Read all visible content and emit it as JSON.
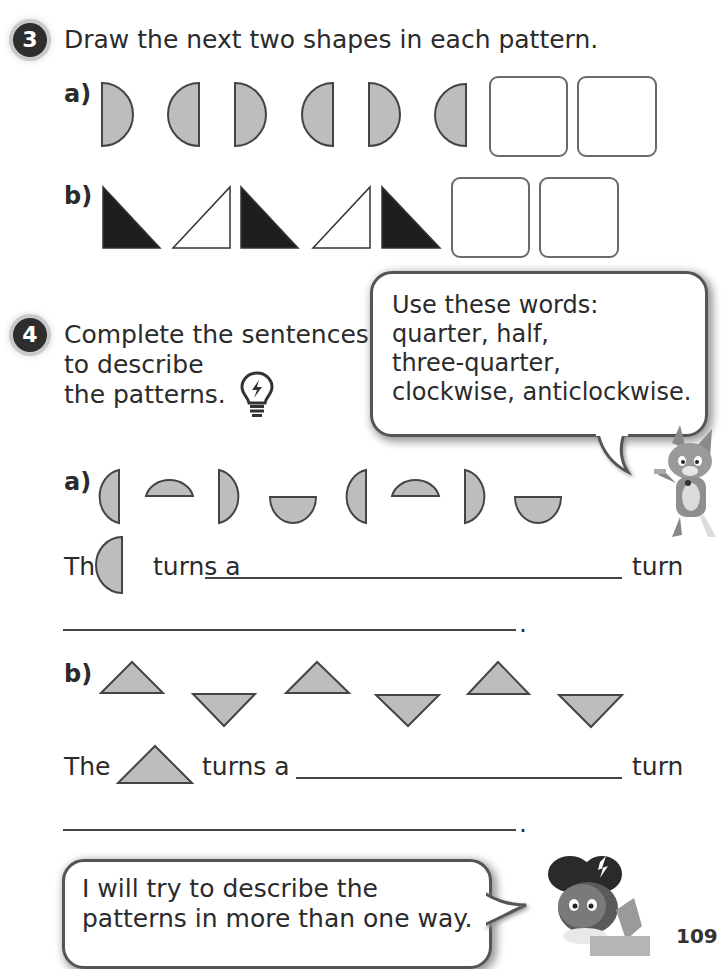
{
  "question3": {
    "number": "3",
    "prompt": "Draw the next two shapes in each pattern.",
    "part_a": {
      "label": "a)",
      "shapes": [
        "half-circle-right",
        "half-circle-left",
        "half-circle-right",
        "half-circle-left",
        "half-circle-right",
        "half-circle-left"
      ],
      "answer_boxes": 2
    },
    "part_b": {
      "label": "b)",
      "shapes": [
        "right-triangle-black",
        "right-triangle-white",
        "right-triangle-black",
        "right-triangle-white",
        "right-triangle-black"
      ],
      "answer_boxes": 2
    }
  },
  "question4": {
    "number": "4",
    "prompt_lines": [
      "Complete the sentences",
      "to describe",
      "the patterns."
    ],
    "hint_icon": "lightbulb-icon",
    "word_bubble": {
      "lines": [
        "Use these words:",
        "quarter, half,",
        "three-quarter,",
        "clockwise, anticlockwise."
      ]
    },
    "part_a": {
      "label": "a)",
      "shapes": [
        "half-circle-left",
        "half-circle-up",
        "half-circle-right",
        "half-circle-down",
        "half-circle-left",
        "half-circle-up",
        "half-circle-right",
        "half-circle-down"
      ],
      "sentence_start": "The",
      "sentence_mid": "turns a",
      "sentence_end": "turn",
      "period": "."
    },
    "part_b": {
      "label": "b)",
      "shapes": [
        "triangle-up",
        "triangle-down",
        "triangle-up",
        "triangle-down",
        "triangle-up",
        "triangle-down"
      ],
      "sentence_start": "The",
      "sentence_mid": "turns a",
      "sentence_end": "turn",
      "period": "."
    }
  },
  "footer_bubble": {
    "lines": [
      "I will try to describe the",
      "patterns in more than one way."
    ]
  },
  "page_number": "109",
  "colors": {
    "shape_fill": "#bdbdbd",
    "shape_stroke": "#444444",
    "black_fill": "#1e1e1e",
    "text": "#2b2b2b"
  }
}
